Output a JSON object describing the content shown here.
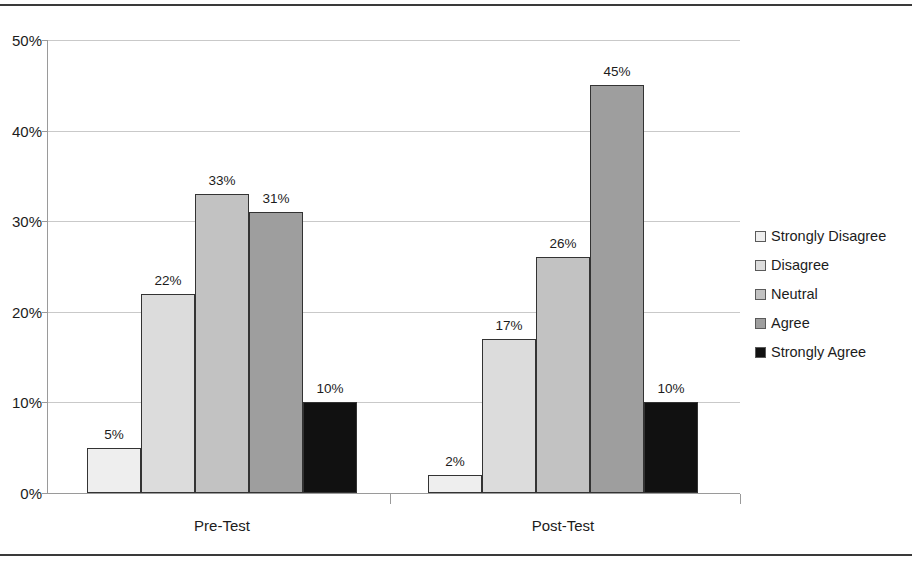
{
  "chart_data": {
    "type": "bar",
    "title": "",
    "subtitle": "",
    "xlabel": "",
    "ylabel": "",
    "categories": [
      "Pre-Test",
      "Post-Test"
    ],
    "series": [
      {
        "name": "Strongly Disagree",
        "values": [
          5,
          2
        ],
        "labels": [
          "5%",
          "2%"
        ],
        "color": "#eeeeee"
      },
      {
        "name": "Disagree",
        "values": [
          22,
          17
        ],
        "labels": [
          "22%",
          "17%"
        ],
        "color": "#dcdcdc"
      },
      {
        "name": "Neutral",
        "values": [
          33,
          26
        ],
        "labels": [
          "33%",
          "26%"
        ],
        "color": "#c2c2c2"
      },
      {
        "name": "Agree",
        "values": [
          31,
          45
        ],
        "labels": [
          "31%",
          "45%"
        ],
        "color": "#9e9e9e"
      },
      {
        "name": "Strongly Agree",
        "values": [
          10,
          10
        ],
        "labels": [
          "10%",
          "10%"
        ],
        "color": "#111111"
      }
    ],
    "ylim": [
      0,
      50
    ],
    "ytick_values": [
      0,
      10,
      20,
      30,
      40,
      50
    ],
    "ytick_labels": [
      "0%",
      "10%",
      "20%",
      "30%",
      "40%",
      "50%"
    ],
    "grid": true,
    "grid_axis": "y",
    "legend_position": "right",
    "value_labels_shown": true,
    "bar_border_color": "#333333"
  },
  "legend": {
    "items": [
      {
        "label": "Strongly Disagree",
        "color": "#eeeeee"
      },
      {
        "label": "Disagree",
        "color": "#dcdcdc"
      },
      {
        "label": "Neutral",
        "color": "#c2c2c2"
      },
      {
        "label": "Agree",
        "color": "#9e9e9e"
      },
      {
        "label": "Strongly Agree",
        "color": "#111111"
      }
    ]
  }
}
